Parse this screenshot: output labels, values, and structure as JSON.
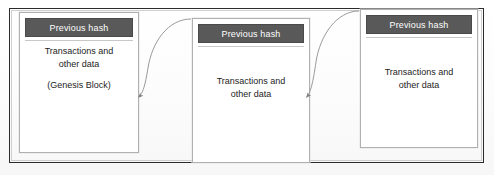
{
  "diagram": {
    "frame_color": "#2b2b2b",
    "header_fill": "#595959",
    "header_text_color": "#ffffff",
    "body_text_color": "#1d1d1d",
    "arrow_color": "#8a8a8a",
    "background": "#fdfdfd"
  },
  "blocks": [
    {
      "id": "block-1",
      "header": "Previous hash",
      "body_line_1": "Transactions and",
      "body_line_2": "other data",
      "note": "(Genesis Block)"
    },
    {
      "id": "block-2",
      "header": "Previous hash",
      "body_line_1": "Transactions and",
      "body_line_2": "other data",
      "note": ""
    },
    {
      "id": "block-3",
      "header": "Previous hash",
      "body_line_1": "Transactions and",
      "body_line_2": "other data",
      "note": ""
    }
  ],
  "arrows": [
    {
      "id": "arrow-1",
      "from_block": "block-2",
      "to_block": "block-1",
      "label": ""
    },
    {
      "id": "arrow-2",
      "from_block": "block-3",
      "to_block": "block-2",
      "label": ""
    }
  ]
}
